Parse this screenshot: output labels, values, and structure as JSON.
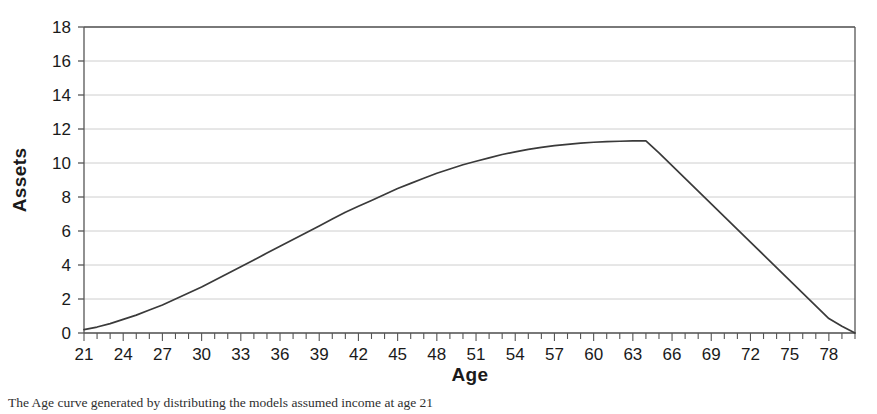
{
  "figure": {
    "background": "#ffffff",
    "caption": "The Age curve generated by distributing the models assumed income at age 21"
  },
  "chart_data": {
    "type": "line",
    "title": "",
    "subtitle": "",
    "xlabel": "Age",
    "ylabel": "Assets",
    "xlim": [
      21,
      80
    ],
    "ylim": [
      0,
      18
    ],
    "ytick_step": 2,
    "xtick_step": 1,
    "xlabel_step": 3,
    "grid": "horizontal",
    "legend": "none",
    "line_color": "#3a3a3a",
    "grid_color": "#c8c8c8",
    "axis_color": "#555555",
    "yticks": [
      0,
      2,
      4,
      6,
      8,
      10,
      12,
      14,
      16,
      18
    ],
    "xticks": [
      21,
      24,
      27,
      30,
      33,
      36,
      39,
      42,
      45,
      48,
      51,
      54,
      57,
      60,
      63,
      66,
      69,
      72,
      75,
      78
    ],
    "annotations": {
      "peak_age": 64,
      "peak_value": 11.3,
      "start_age": 21,
      "start_value": 0.2,
      "end_age": 80,
      "end_value": 0.0
    },
    "series": [
      {
        "name": "Assets",
        "x": [
          21,
          22,
          23,
          24,
          25,
          26,
          27,
          28,
          29,
          30,
          31,
          32,
          33,
          34,
          35,
          36,
          37,
          38,
          39,
          40,
          41,
          42,
          43,
          44,
          45,
          46,
          47,
          48,
          49,
          50,
          51,
          52,
          53,
          54,
          55,
          56,
          57,
          58,
          59,
          60,
          61,
          62,
          63,
          64,
          65,
          66,
          67,
          68,
          69,
          70,
          71,
          72,
          73,
          74,
          75,
          76,
          77,
          78,
          79,
          80
        ],
        "values": [
          0.2,
          0.35,
          0.55,
          0.8,
          1.05,
          1.35,
          1.65,
          2.0,
          2.35,
          2.7,
          3.1,
          3.5,
          3.9,
          4.3,
          4.7,
          5.1,
          5.5,
          5.9,
          6.3,
          6.7,
          7.1,
          7.45,
          7.8,
          8.15,
          8.5,
          8.8,
          9.1,
          9.4,
          9.65,
          9.9,
          10.1,
          10.3,
          10.5,
          10.65,
          10.8,
          10.92,
          11.02,
          11.1,
          11.17,
          11.22,
          11.26,
          11.28,
          11.3,
          11.3,
          10.6,
          9.85,
          9.1,
          8.35,
          7.6,
          6.85,
          6.1,
          5.35,
          4.6,
          3.85,
          3.1,
          2.35,
          1.6,
          0.85,
          0.4,
          0.0
        ]
      }
    ]
  },
  "geometry": {
    "plot_left": 84,
    "plot_right": 855,
    "plot_top": 27,
    "plot_bottom": 333
  }
}
